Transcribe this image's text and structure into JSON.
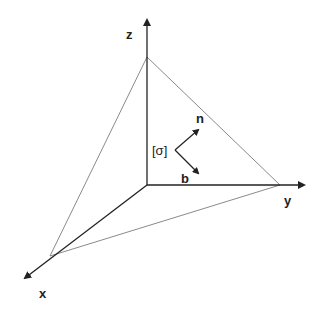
{
  "diagram": {
    "axes": {
      "x_label": "x",
      "y_label": "y",
      "z_label": "z"
    },
    "stress_tensor_label": "[σ]",
    "normal_vector_label": "n",
    "b_vector_label": "b",
    "colors": {
      "axis": "#222222",
      "plane": "#8a8a8a"
    }
  }
}
